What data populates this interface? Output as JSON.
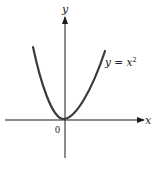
{
  "figure": {
    "x_axis_label": "x",
    "y_axis_label": "y",
    "origin_label": "0",
    "curve_label_lhs": "y = x",
    "curve_label_exp": "2",
    "curve_equation": "y = x^2",
    "colors": {
      "axes": "#1a1a1a",
      "curve": "#3a3a3a",
      "text": "#222222"
    }
  }
}
